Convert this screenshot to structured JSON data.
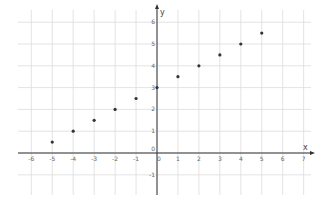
{
  "chart_data": {
    "type": "scatter",
    "title": "",
    "xlabel": "x",
    "ylabel": "y",
    "xlim": [
      -6.7,
      7.3
    ],
    "ylim": [
      -1.9,
      6.6
    ],
    "grid": true,
    "legend": null,
    "x_ticks": [
      -6,
      -5,
      -4,
      -3,
      -2,
      -1,
      0,
      1,
      2,
      3,
      4,
      5,
      6,
      7
    ],
    "y_ticks": [
      -1,
      0,
      1,
      2,
      3,
      4,
      5,
      6
    ],
    "x_tick_labels": [
      "-6",
      "-5",
      "-4",
      "-3",
      "-2",
      "-1",
      "0",
      "1",
      "2",
      "3",
      "4",
      "5",
      "6",
      "7"
    ],
    "y_tick_labels": [
      "-1",
      "0",
      "1",
      "2",
      "3",
      "4",
      "5",
      "6"
    ],
    "series": [
      {
        "name": "points",
        "color": "#333333",
        "x": [
          -5,
          -4,
          -3,
          -2,
          -1,
          0,
          1,
          2,
          3,
          4,
          5
        ],
        "y": [
          0.5,
          1,
          1.5,
          2,
          2.5,
          3,
          3.5,
          4,
          4.5,
          5,
          5.5
        ]
      }
    ]
  },
  "colors": {
    "grid": "#dcdcdc",
    "axis": "#333333",
    "tick_label": "#666666",
    "point": "#333333",
    "background": "#ffffff"
  }
}
